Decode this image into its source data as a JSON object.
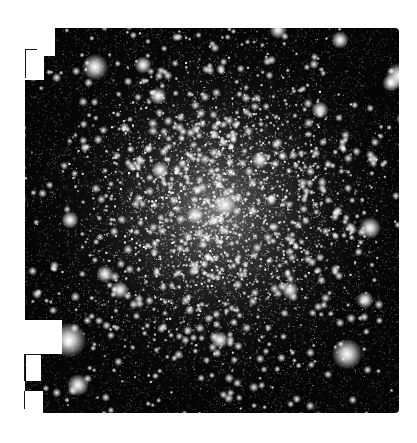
{
  "image": {
    "subject": "globular star cluster",
    "description": "Monochrome telescope image of a dense globular star cluster on black sky",
    "canvas": {
      "width": 417,
      "height": 443,
      "background": "#ffffff"
    },
    "field": {
      "left": 25,
      "top": 28,
      "right": 399,
      "bottom": 413,
      "sky_color": "#050505",
      "corner_radius": 4
    },
    "cluster": {
      "center_x": 215,
      "center_y": 210,
      "core_radius": 60,
      "halo_radius": 210
    },
    "stars": {
      "seed": 1337,
      "faint_count": 9000,
      "medium_count": 900,
      "core_count": 2600,
      "bright": [
        {
          "x": 95,
          "y": 67,
          "r": 6
        },
        {
          "x": 69,
          "y": 340,
          "r": 8
        },
        {
          "x": 347,
          "y": 354,
          "r": 7
        },
        {
          "x": 399,
          "y": 76,
          "r": 6
        },
        {
          "x": 391,
          "y": 83,
          "r": 4
        },
        {
          "x": 78,
          "y": 385,
          "r": 5
        },
        {
          "x": 143,
          "y": 65,
          "r": 4
        },
        {
          "x": 158,
          "y": 96,
          "r": 4
        },
        {
          "x": 370,
          "y": 228,
          "r": 5
        },
        {
          "x": 340,
          "y": 40,
          "r": 4
        },
        {
          "x": 278,
          "y": 30,
          "r": 4
        },
        {
          "x": 70,
          "y": 220,
          "r": 4
        },
        {
          "x": 105,
          "y": 274,
          "r": 4
        },
        {
          "x": 225,
          "y": 205,
          "r": 5
        },
        {
          "x": 195,
          "y": 215,
          "r": 4
        },
        {
          "x": 260,
          "y": 160,
          "r": 4
        },
        {
          "x": 160,
          "y": 170,
          "r": 4
        },
        {
          "x": 290,
          "y": 290,
          "r": 4
        },
        {
          "x": 120,
          "y": 290,
          "r": 4
        },
        {
          "x": 365,
          "y": 300,
          "r": 4
        },
        {
          "x": 220,
          "y": 340,
          "r": 4
        },
        {
          "x": 320,
          "y": 110,
          "r": 4
        }
      ]
    },
    "masks": [
      {
        "name": "top-left-step",
        "x": 25,
        "y": 28,
        "w": 30,
        "h": 21
      },
      {
        "name": "top-left-notch",
        "x": 25,
        "y": 49,
        "w": 19,
        "h": 31
      },
      {
        "name": "top-left-step-lower",
        "x": 44,
        "y": 28,
        "w": 11,
        "h": 28
      },
      {
        "name": "bottom-left-notch",
        "x": 25,
        "y": 320,
        "w": 37,
        "h": 34
      },
      {
        "name": "bottom-left-box",
        "x": 26,
        "y": 355,
        "w": 15,
        "h": 26
      },
      {
        "name": "bottom-left-foot",
        "x": 25,
        "y": 391,
        "w": 18,
        "h": 22
      }
    ],
    "mask_borders": [
      {
        "x": 25,
        "y": 49,
        "w": 12,
        "h": 1
      },
      {
        "x": 25,
        "y": 49,
        "w": 1,
        "h": 29
      },
      {
        "x": 24,
        "y": 354,
        "w": 18,
        "h": 1
      },
      {
        "x": 24,
        "y": 354,
        "w": 1,
        "h": 27
      },
      {
        "x": 24,
        "y": 391,
        "w": 1,
        "h": 18
      }
    ]
  }
}
